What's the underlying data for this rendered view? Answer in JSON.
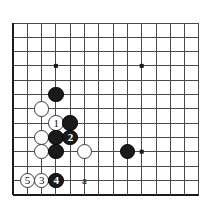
{
  "diagram": {
    "type": "go-board-diagram",
    "title": "",
    "board": {
      "cell_size": 14.3,
      "origin_x": 13,
      "origin_y": 23,
      "cols": 13,
      "rows": 12,
      "edges": {
        "left": true,
        "top": false,
        "right": false,
        "bottom": true
      },
      "line_color": "#4a4a4a",
      "edge_color": "#1a1a1a",
      "background": "#ffffff",
      "star_points": [
        {
          "col": 3,
          "row": 3
        },
        {
          "col": 9,
          "row": 3
        },
        {
          "col": 9,
          "row": 9
        }
      ]
    },
    "stones": [
      {
        "id": "b-top",
        "color": "black",
        "col": 3,
        "row": 5,
        "label": ""
      },
      {
        "id": "w-upper",
        "color": "white",
        "col": 2,
        "row": 6,
        "label": ""
      },
      {
        "id": "w-move1",
        "color": "white",
        "col": 3,
        "row": 7,
        "label": "1"
      },
      {
        "id": "b-right1",
        "color": "black",
        "col": 4,
        "row": 7,
        "label": ""
      },
      {
        "id": "w-mid",
        "color": "white",
        "col": 2,
        "row": 8,
        "label": ""
      },
      {
        "id": "b-mid",
        "color": "black",
        "col": 3,
        "row": 8,
        "label": ""
      },
      {
        "id": "b-move2",
        "color": "black",
        "col": 4,
        "row": 8,
        "label": "2"
      },
      {
        "id": "w-lower",
        "color": "white",
        "col": 2,
        "row": 9,
        "label": ""
      },
      {
        "id": "b-lower",
        "color": "black",
        "col": 3,
        "row": 9,
        "label": ""
      },
      {
        "id": "w-right",
        "color": "white",
        "col": 5,
        "row": 9,
        "label": ""
      },
      {
        "id": "b-far",
        "color": "black",
        "col": 8,
        "row": 9,
        "label": ""
      },
      {
        "id": "w-move5",
        "color": "white",
        "col": 1,
        "row": 11,
        "label": "5"
      },
      {
        "id": "w-move3",
        "color": "white",
        "col": 2,
        "row": 11,
        "label": "3"
      },
      {
        "id": "b-move4",
        "color": "black",
        "col": 3,
        "row": 11,
        "label": "4"
      }
    ],
    "point_labels": [
      {
        "id": "pt-a",
        "text": "a",
        "col": 5,
        "row": 11
      }
    ],
    "move_sequence": [
      "1",
      "2",
      "3",
      "4",
      "5"
    ],
    "colors": {
      "black_stone": "#1a1a1a",
      "white_stone": "#ffffff",
      "white_stone_border": "#3a3a3a",
      "grid_line": "#4a4a4a",
      "board_edge": "#1a1a1a"
    }
  }
}
